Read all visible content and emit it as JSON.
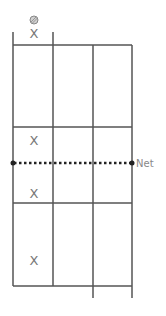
{
  "diagram": {
    "type": "court-positions",
    "net_label": "Net",
    "player_marker": "X",
    "ball_icon": "ball",
    "players": [
      {
        "id": "server",
        "label": "X"
      },
      {
        "id": "partner-near-net",
        "label": "X"
      },
      {
        "id": "opponent-near-net",
        "label": "X"
      },
      {
        "id": "opponent-back",
        "label": "X"
      }
    ],
    "colors": {
      "lines": "#555555",
      "net": "#222222",
      "marker": "#777777",
      "ball": "#aaaaaa"
    }
  }
}
